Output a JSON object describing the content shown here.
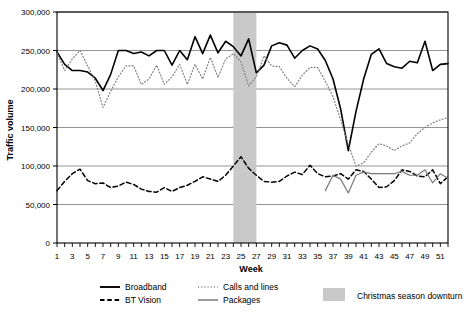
{
  "chart_data": {
    "type": "line",
    "title": "",
    "xlabel": "Week",
    "ylabel": "Traffic volume",
    "xlim": [
      1,
      52
    ],
    "ylim": [
      0,
      300000
    ],
    "grid": true,
    "grid_axis": "y",
    "legend_position": "bottom",
    "ytick_labels": [
      "0",
      "50,000",
      "100,000",
      "150,000",
      "200,000",
      "250,000",
      "300,000"
    ],
    "ytick_values": [
      0,
      50000,
      100000,
      150000,
      200000,
      250000,
      300000
    ],
    "xtick_labels": [
      "1",
      "3",
      "5",
      "7",
      "9",
      "11",
      "13",
      "15",
      "17",
      "19",
      "21",
      "23",
      "25",
      "27",
      "29",
      "31",
      "33",
      "35",
      "37",
      "39",
      "41",
      "43",
      "45",
      "47",
      "49",
      "51"
    ],
    "xtick_values": [
      1,
      3,
      5,
      7,
      9,
      11,
      13,
      15,
      17,
      19,
      21,
      23,
      25,
      27,
      29,
      31,
      33,
      35,
      37,
      39,
      41,
      43,
      45,
      47,
      49,
      51
    ],
    "x": [
      1,
      2,
      3,
      4,
      5,
      6,
      7,
      8,
      9,
      10,
      11,
      12,
      13,
      14,
      15,
      16,
      17,
      18,
      19,
      20,
      21,
      22,
      23,
      24,
      25,
      26,
      27,
      28,
      29,
      30,
      31,
      32,
      33,
      34,
      35,
      36,
      37,
      38,
      39,
      40,
      41,
      42,
      43,
      44,
      45,
      46,
      47,
      48,
      49,
      50,
      51,
      52
    ],
    "annotations": [
      {
        "label": "Christmas season downturn",
        "type": "vspan",
        "x_start": 24,
        "x_end": 27,
        "color": "#c9c9c9"
      }
    ],
    "series": [
      {
        "name": "Broadband",
        "style": "solid",
        "color": "#000000",
        "width": 1.6,
        "values": [
          248000,
          232000,
          224000,
          224000,
          222000,
          214000,
          198000,
          219000,
          250000,
          250000,
          246000,
          248000,
          243000,
          250000,
          250000,
          231000,
          250000,
          238000,
          268000,
          246000,
          270000,
          247000,
          262000,
          255000,
          243000,
          265000,
          221000,
          231000,
          256000,
          260000,
          257000,
          240000,
          250000,
          256000,
          252000,
          237000,
          213000,
          174000,
          120000,
          171000,
          213000,
          245000,
          252000,
          233000,
          229000,
          227000,
          236000,
          234000,
          262000,
          224000,
          232000,
          233000
        ]
      },
      {
        "name": "Calls and lines",
        "style": "dotted",
        "color": "#808080",
        "width": 1.2,
        "values": [
          247000,
          224000,
          239000,
          250000,
          230000,
          210000,
          176000,
          197000,
          216000,
          230000,
          230000,
          206000,
          213000,
          231000,
          206000,
          216000,
          232000,
          206000,
          232000,
          213000,
          241000,
          215000,
          239000,
          246000,
          235000,
          204000,
          216000,
          243000,
          230000,
          229000,
          214000,
          203000,
          218000,
          228000,
          228000,
          210000,
          190000,
          160000,
          128000,
          100000,
          104000,
          118000,
          129000,
          126000,
          120000,
          126000,
          130000,
          142000,
          150000,
          156000,
          160000,
          163000
        ]
      },
      {
        "name": "BT Vision",
        "style": "dashed",
        "color": "#000000",
        "width": 1.5,
        "values": [
          68000,
          80000,
          90000,
          96000,
          81000,
          77000,
          78000,
          72000,
          74000,
          79000,
          76000,
          70000,
          67000,
          66000,
          72000,
          67000,
          72000,
          75000,
          80000,
          86000,
          83000,
          80000,
          88000,
          100000,
          112000,
          97000,
          88000,
          80000,
          79000,
          80000,
          87000,
          92000,
          89000,
          101000,
          90000,
          86000,
          87000,
          90000,
          83000,
          95000,
          93000,
          83000,
          72000,
          73000,
          81000,
          95000,
          93000,
          87000,
          86000,
          95000,
          77000,
          86000
        ]
      },
      {
        "name": "Packages",
        "style": "solid",
        "color": "#7a7a7a",
        "width": 1.2,
        "start_week": 36,
        "values": [
          null,
          null,
          null,
          null,
          null,
          null,
          null,
          null,
          null,
          null,
          null,
          null,
          null,
          null,
          null,
          null,
          null,
          null,
          null,
          null,
          null,
          null,
          null,
          null,
          null,
          null,
          null,
          null,
          null,
          null,
          null,
          null,
          null,
          null,
          null,
          68000,
          88000,
          83000,
          65000,
          88000,
          92000,
          90000,
          90000,
          90000,
          90000,
          93000,
          88000,
          88000,
          95000,
          78000,
          90000,
          84000
        ]
      }
    ]
  },
  "legend": {
    "items": [
      {
        "label": "Broadband",
        "swatch": "solid-black"
      },
      {
        "label": "Calls and lines",
        "swatch": "dotted-gray"
      },
      {
        "label": "BT Vision",
        "swatch": "dashed-black"
      },
      {
        "label": "Packages",
        "swatch": "solid-gray"
      }
    ],
    "shaded": {
      "label": "Christmas season downturn",
      "color": "#c9c9c9"
    }
  }
}
